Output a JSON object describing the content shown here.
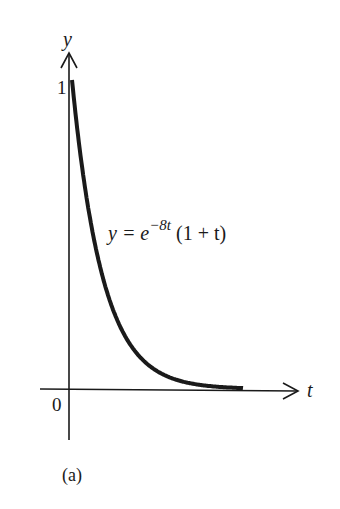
{
  "figure": {
    "caption": "(a)",
    "y_axis_label": "y",
    "x_axis_label": "t",
    "y_tick_label": "1",
    "origin_label": "0",
    "equation": {
      "lhs": "y = e",
      "exponent": "−8t",
      "rhs": " (1 + t)"
    }
  },
  "chart_data": {
    "type": "line",
    "title": "",
    "xlabel": "t",
    "ylabel": "y",
    "series": [
      {
        "name": "y = e^(-8t)(1 + t)",
        "x": [
          0,
          0.05,
          0.1,
          0.15,
          0.2,
          0.25,
          0.3,
          0.4,
          0.5,
          0.6,
          0.7,
          0.8
        ],
        "values": [
          1.0,
          0.704,
          0.494,
          0.346,
          0.242,
          0.169,
          0.118,
          0.057,
          0.027,
          0.013,
          0.006,
          0.003
        ]
      }
    ],
    "annotations": [
      "y = e^(−8t) (1 + t)",
      "1",
      "0"
    ],
    "ylim": [
      0,
      1.1
    ],
    "grid": false,
    "legend": "none"
  },
  "colors": {
    "ink": "#1a1a1a",
    "background": "#ffffff"
  }
}
